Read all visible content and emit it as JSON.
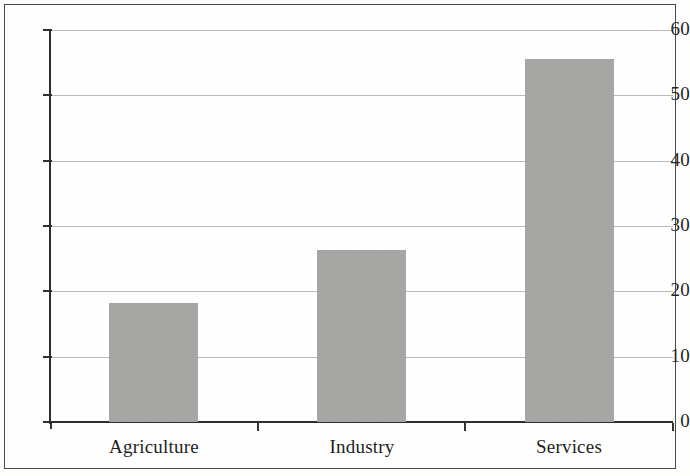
{
  "chart_data": {
    "type": "bar",
    "title": "",
    "subtitle": "",
    "xlabel": "",
    "ylabel": "",
    "categories": [
      "Agriculture",
      "Industry",
      "Services"
    ],
    "values": [
      18.2,
      26.3,
      55.5
    ],
    "ylim": [
      0,
      60
    ],
    "yticks": [
      0,
      10,
      20,
      30,
      40,
      50,
      60
    ],
    "ytick_labels": [
      "0",
      "10",
      "20",
      "30",
      "40",
      "50",
      "60"
    ],
    "grid": true,
    "legend": null,
    "series": [
      {
        "name": "",
        "values": [
          18.2,
          26.3,
          55.5
        ]
      }
    ],
    "bar_color": "#a9a9a7",
    "axis_color": "#2e2e2c",
    "grid_color": "#b9b9b7",
    "background_color": "#fefefe",
    "frame_color": "#4a4a48"
  }
}
